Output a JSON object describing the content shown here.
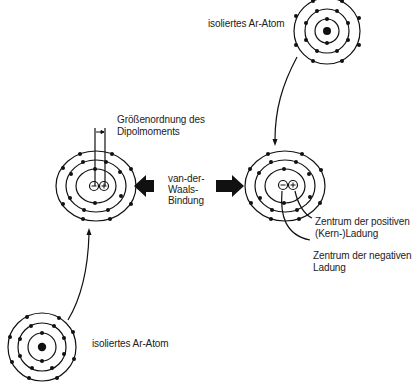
{
  "labels": {
    "top_atom": "isoliertes Ar-Atom",
    "bottom_atom": "isoliertes Ar-Atom",
    "dipole_line1": "Größenordnung des",
    "dipole_line2": "Dipolmoments",
    "bond_line1": "van-der-",
    "bond_line2": "Waals-",
    "bond_line3": "Bindung",
    "positive_line1": "Zentrum der positiven",
    "positive_line2": "(Kern-)Ladung",
    "negative_line1": "Zentrum der negativen",
    "negative_line2": "Ladung"
  },
  "symbols": {
    "minus": "−",
    "plus": "+"
  },
  "colors": {
    "ink": "#111111",
    "background": "#ffffff"
  }
}
